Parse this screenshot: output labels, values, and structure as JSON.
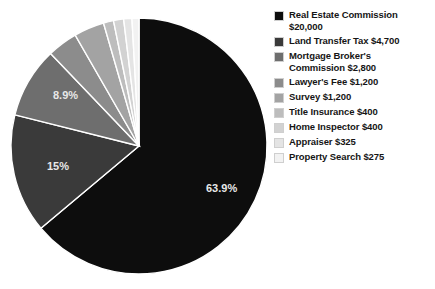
{
  "chart_data": {
    "type": "pie",
    "title": "",
    "currency": "$",
    "total": 31300,
    "legend_position": "right",
    "categories": [
      "Real Estate Commission",
      "Land Transfer Tax",
      "Mortgage Broker's Commission",
      "Lawyer's Fee",
      "Survey",
      "Title Insurance",
      "Home Inspector",
      "Appraiser",
      "Property Search"
    ],
    "values": [
      20000,
      4700,
      2800,
      1200,
      1200,
      400,
      400,
      325,
      275
    ],
    "value_labels": [
      "$20,000",
      "$4,700",
      "$2,800",
      "$1,200",
      "$1,200",
      "$400",
      "$400",
      "$325",
      "$275"
    ],
    "percentages": [
      63.9,
      15.0,
      8.9,
      3.8,
      3.8,
      1.3,
      1.3,
      1.0,
      0.9
    ],
    "colors": [
      "#0d0d0d",
      "#3a3a3a",
      "#6e6e6e",
      "#8c8c8c",
      "#a3a3a3",
      "#bdbdbd",
      "#d2d2d2",
      "#e4e4e4",
      "#f2f2f2"
    ],
    "visible_slice_labels": [
      {
        "text": "63.9%",
        "x": 206,
        "y": 192
      },
      {
        "text": "15%",
        "x": 47,
        "y": 170
      },
      {
        "text": "8.9%",
        "x": 53,
        "y": 99
      }
    ],
    "geometry": {
      "cx": 139,
      "cy": 146,
      "r": 128,
      "start_angle_deg": 0,
      "direction": "clockwise"
    }
  },
  "legend": {
    "items": [
      {
        "label_line1": "Real Estate Commission",
        "label_line2": "$20,000",
        "color": "#0d0d0d"
      },
      {
        "label_line1": "Land Transfer Tax $4,700",
        "label_line2": "",
        "color": "#3a3a3a"
      },
      {
        "label_line1": "Mortgage Broker's",
        "label_line2": "Commission $2,800",
        "color": "#6e6e6e"
      },
      {
        "label_line1": "Lawyer's Fee $1,200",
        "label_line2": "",
        "color": "#8c8c8c"
      },
      {
        "label_line1": "Survey $1,200",
        "label_line2": "",
        "color": "#a3a3a3"
      },
      {
        "label_line1": "Title Insurance $400",
        "label_line2": "",
        "color": "#bdbdbd"
      },
      {
        "label_line1": "Home Inspector $400",
        "label_line2": "",
        "color": "#d2d2d2"
      },
      {
        "label_line1": "Appraiser $325",
        "label_line2": "",
        "color": "#e4e4e4"
      },
      {
        "label_line1": "Property Search $275",
        "label_line2": "",
        "color": "#f2f2f2"
      }
    ]
  }
}
